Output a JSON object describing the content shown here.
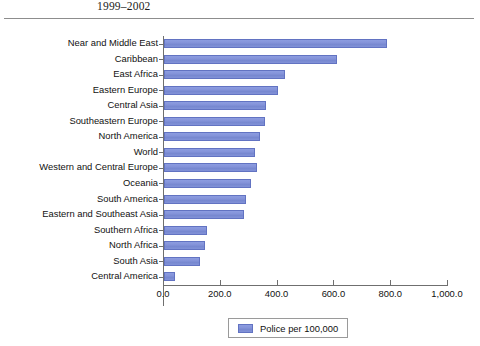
{
  "header": {
    "caption": "1999–2002"
  },
  "chart_data": {
    "type": "bar",
    "orientation": "horizontal",
    "title": "1999–2002",
    "xlabel": "",
    "ylabel": "",
    "xlim": [
      0,
      1000
    ],
    "xticks": [
      "0.0",
      "200.0",
      "400.0",
      "600.0",
      "800.0",
      "1,000.0"
    ],
    "xtick_values": [
      0,
      200,
      400,
      600,
      800,
      1000
    ],
    "grid": false,
    "legend": {
      "position": "bottom-center",
      "entries": [
        {
          "label": "Police per 100,000",
          "color": "#7e8fd6"
        }
      ]
    },
    "series_name": "Police per 100,000",
    "bar_color": "#7e8fd6",
    "bar_border_color": "#6273c2",
    "categories": [
      "Near and Middle East",
      "Caribbean",
      "East Africa",
      "Eastern Europe",
      "Central Asia",
      "Southeastern Europe",
      "North America",
      "World",
      "Western and Central Europe",
      "Oceania",
      "South America",
      "Eastern and Southeast Asia",
      "Southern Africa",
      "North Africa",
      "South Asia",
      "Central America"
    ],
    "values": [
      785,
      610,
      425,
      400,
      358,
      355,
      338,
      322,
      328,
      305,
      290,
      282,
      150,
      145,
      128,
      38
    ]
  }
}
